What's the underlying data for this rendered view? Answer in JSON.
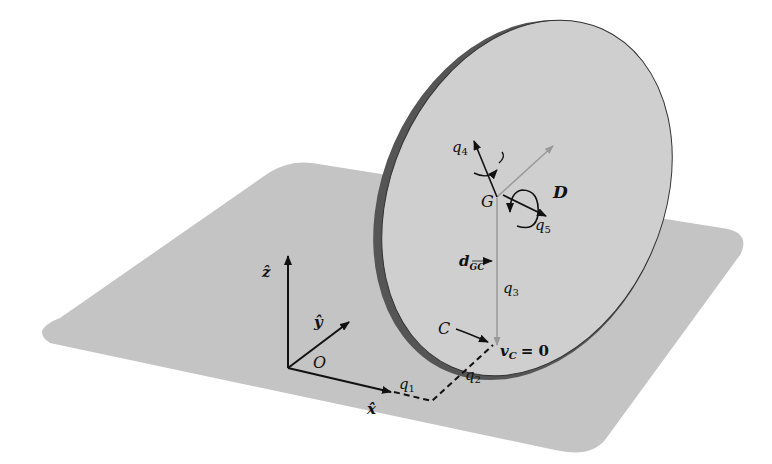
{
  "figure": {
    "colors": {
      "plane": "#c4c4c4",
      "disc": "#cdcdcd",
      "disc_rim": "#555555",
      "ink": "#111111",
      "guide": "#9a9a9a"
    }
  },
  "labels": {
    "z_axis": "ẑ",
    "y_axis": "ŷ",
    "x_axis": "x̂",
    "origin": "O",
    "q1": "q",
    "q1_sub": "1",
    "q2": "q",
    "q2_sub": "2",
    "q3": "q",
    "q3_sub": "3",
    "q4": "q",
    "q4_sub": "4",
    "q5": "q",
    "q5_sub": "5",
    "center": "G",
    "disc": "D",
    "contact": "C",
    "d_vec": "d",
    "d_sub": "GC",
    "vc": "v",
    "vc_sub": "C",
    "vc_eq": "= 0"
  }
}
